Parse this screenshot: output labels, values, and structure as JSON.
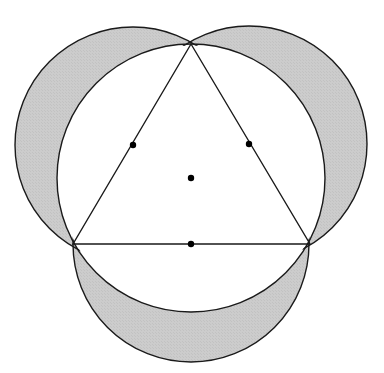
{
  "figure": {
    "canvas": {
      "width": 384,
      "height": 373,
      "background": "#ffffff"
    },
    "colors": {
      "stroke": "#1a1a1a",
      "shading": "#c9c9c9",
      "shading_alt": "#cfcfcf",
      "point_fill": "#000000",
      "interior_fill": "#ffffff"
    },
    "stroke_width": 1.4
  },
  "chart_data": {
    "type": "diagram",
    "xlabel": "",
    "ylabel": "",
    "xlim": [
      0,
      384
    ],
    "ylim": [
      0,
      373
    ],
    "grid": false,
    "legend": "none",
    "annotations": [],
    "triangle": {
      "name": "equilateral-triangle",
      "vertices": [
        {
          "label": "apex",
          "x": 191,
          "y": 44
        },
        {
          "label": "bottom-left",
          "x": 73,
          "y": 244
        },
        {
          "label": "bottom-right",
          "x": 310,
          "y": 244
        }
      ],
      "side_length": 237,
      "filled": false
    },
    "circumcircle": {
      "name": "circumcircle",
      "cx": 191,
      "cy": 178,
      "r": 134,
      "filled": true,
      "fill": "#ffffff"
    },
    "side_circles": [
      {
        "name": "left-side-circle",
        "cx": 133,
        "cy": 145,
        "r": 118
      },
      {
        "name": "right-side-circle",
        "cx": 249,
        "cy": 144,
        "r": 118
      },
      {
        "name": "bottom-side-circle",
        "cx": 191,
        "cy": 244,
        "r": 118
      }
    ],
    "points": [
      {
        "name": "centroid-point",
        "x": 191,
        "y": 178,
        "r": 3.2
      },
      {
        "name": "left-side-midpoint",
        "x": 133,
        "y": 145,
        "r": 3.2
      },
      {
        "name": "right-side-midpoint",
        "x": 249,
        "y": 144,
        "r": 3.2
      },
      {
        "name": "bottom-side-midpoint",
        "x": 191,
        "y": 244,
        "r": 3.2
      }
    ],
    "shaded_regions": {
      "description": "Parts of the three side-circles lying outside the circumcircle (three lunes)",
      "count": 3,
      "fill": "#c9c9c9"
    }
  }
}
